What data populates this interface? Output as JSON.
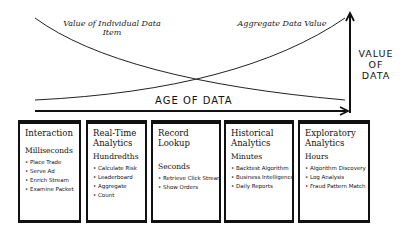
{
  "curves": {
    "individual_label": "Value of Individual Data Item",
    "aggregate_label": "Aggregate Data Value"
  },
  "axes": {
    "x_label": "AGE OF DATA",
    "y_label_lines": [
      "VALUE",
      "OF",
      "DATA"
    ]
  },
  "categories": [
    {
      "title": "Interaction",
      "timescale": "Milliseconds",
      "items": [
        "Place Trade",
        "Serve Ad",
        "Enrich Stream",
        "Examine Packet"
      ]
    },
    {
      "title": "Real-Time Analytics",
      "timescale": "Hundredths",
      "items": [
        "Calculate Risk",
        "Leaderboard",
        "Aggregate",
        "Count"
      ]
    },
    {
      "title": "Record Lookup",
      "timescale": "Seconds",
      "items": [
        "Retrieve Click Stream",
        "Show Orders"
      ]
    },
    {
      "title": "Historical Analytics",
      "timescale": "Minutes",
      "items": [
        "Backtest Algorithm",
        "Business Intelligence",
        "Daily Reports"
      ]
    },
    {
      "title": "Exploratory Analytics",
      "timescale": "Hours",
      "items": [
        "Algorithm Discovery",
        "Log Analysis",
        "Fraud Pattern Match"
      ]
    }
  ]
}
